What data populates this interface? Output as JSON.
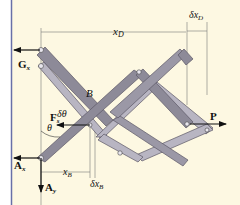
{
  "figure": {
    "background": "#fdf8e2",
    "border_color": "#6870a8",
    "link_dark": "#8d8a98",
    "link_light": "#b8b5c2",
    "link_edge": "#5b5866",
    "dim_line": "#7a7a7a"
  },
  "labels": {
    "xD": "x",
    "xD_sub": "D",
    "dxD": "δx",
    "dxD_sub": "D",
    "Gx": "G",
    "Gx_sub": "x",
    "B": "B",
    "Fs": "F",
    "Fs_sub": "s",
    "dtheta": "δθ",
    "theta": "θ",
    "P": "P",
    "Ax": "A",
    "Ax_sub": "x",
    "Ay": "A",
    "Ay_sub": "y",
    "xB": "x",
    "xB_sub": "B",
    "dxB": "δx",
    "dxB_sub": "B"
  }
}
